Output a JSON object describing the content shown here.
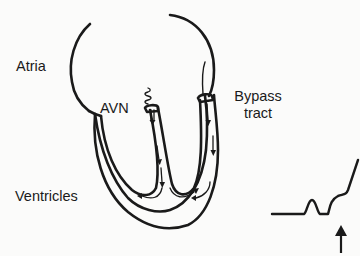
{
  "labels": {
    "atria": "Atria",
    "avn": "AVN",
    "bypass_line1": "Bypass",
    "bypass_line2": "tract",
    "ventricles": "Ventricles"
  },
  "colors": {
    "ink": "#1a1a1a",
    "background": "#fbfbfa"
  },
  "ecg": {
    "description": "ECG trace showing P wave followed by delta wave (slurred upstroke) before QRS",
    "arrow_points_to": "delta-wave"
  }
}
